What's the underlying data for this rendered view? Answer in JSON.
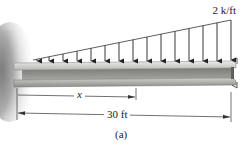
{
  "figure": {
    "caption": "(a)",
    "load": {
      "label": "2 k/ft",
      "type": "triangular distributed load",
      "intensity_at_free_end": "2 k/ft",
      "intensity_at_wall": "0",
      "arrow_count": 15
    },
    "beam": {
      "type": "cantilever wide-flange beam",
      "support": "fixed wall (left)"
    },
    "dimensions": {
      "x_label": "x",
      "length_label": "30 ft"
    },
    "colors": {
      "wall_shadow": "#8a8a8a",
      "beam_light": "#d9d9d6",
      "beam_mid": "#a9a9a5",
      "beam_dark": "#6e6e6a",
      "line": "#333333"
    }
  }
}
